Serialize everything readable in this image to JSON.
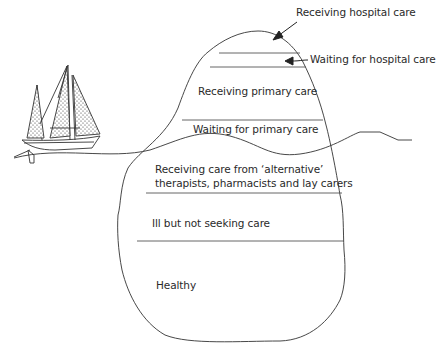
{
  "diagram": {
    "type": "iceberg",
    "annotations": {
      "receiving_hospital_care": "Receiving hospital care",
      "waiting_hospital_care": "Waiting for hospital care"
    },
    "layers": {
      "receiving_primary_care": "Receiving primary care",
      "waiting_primary_care": "Waiting for primary care",
      "alternative_care_line1": "Receiving care from ‘alternative’",
      "alternative_care_line2": "therapists, pharmacists and lay carers",
      "ill_not_seeking": "Ill but not seeking care",
      "healthy": "Healthy"
    },
    "colors": {
      "stroke": "#333333",
      "text": "#2a2a2a",
      "background": "#ffffff"
    }
  }
}
